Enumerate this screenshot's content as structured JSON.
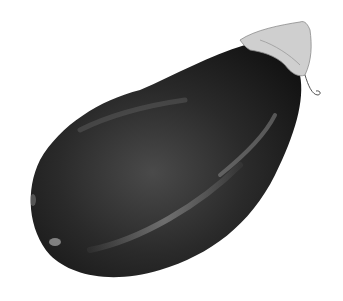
{
  "image": {
    "subject": "eggplant",
    "style": "grayscale watercolor illustration",
    "background": "#ffffff",
    "colors": {
      "body_dark": "#1a1a1a",
      "body_mid": "#3a3a3a",
      "highlight": "#9a9a9a",
      "calyx": "#c8c8c8",
      "calyx_shadow": "#8a8a8a"
    }
  }
}
